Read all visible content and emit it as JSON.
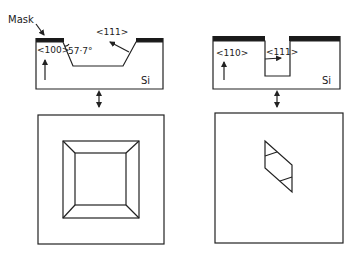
{
  "diagram": {
    "left_panel": {
      "cross_section": {
        "mask_label": "Mask",
        "surface_orientation": "<100>",
        "sidewall_orientation": "<111>",
        "angle_label": "57·7°",
        "material_label": "Si"
      },
      "plan_view": {
        "shape": "square pyramidal pit (truncated)"
      }
    },
    "right_panel": {
      "cross_section": {
        "surface_orientation": "<110>",
        "sidewall_orientation": "<111>",
        "material_label": "Si"
      },
      "plan_view": {
        "shape": "parallelogram trench with vertical walls"
      }
    },
    "colors": {
      "line": "#222222",
      "mask": "#1a1a1a",
      "background": "#ffffff"
    }
  }
}
